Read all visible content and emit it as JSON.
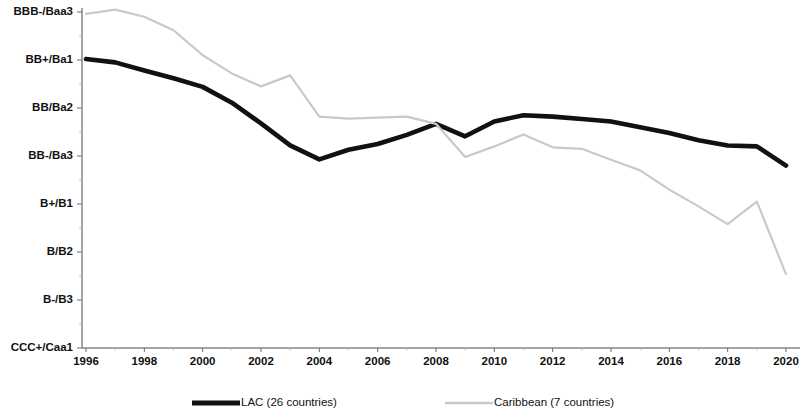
{
  "chart_data": {
    "type": "line",
    "title": "",
    "subtitle": "",
    "xlabel": "",
    "ylabel": "",
    "grid": false,
    "legend_position": "bottom",
    "x": [
      1996,
      1997,
      1998,
      1999,
      2000,
      2001,
      2002,
      2003,
      2004,
      2005,
      2006,
      2007,
      2008,
      2009,
      2010,
      2011,
      2012,
      2013,
      2014,
      2015,
      2016,
      2017,
      2018,
      2019,
      2020
    ],
    "x_tick_labels": [
      "1996",
      "1998",
      "2000",
      "2002",
      "2004",
      "2006",
      "2008",
      "2010",
      "2012",
      "2014",
      "2016",
      "2018",
      "2020"
    ],
    "xlim": [
      1996,
      2020
    ],
    "y_tick_labels": [
      "BBB-/Baa3",
      "BB+/Ba1",
      "BB/Ba2",
      "BB-/Ba3",
      "B+/B1",
      "B/B2",
      "B-/B3",
      "CCC+/Caa1"
    ],
    "y_tick_values": [
      8,
      7,
      6,
      5,
      4,
      3,
      2,
      1
    ],
    "ylim": [
      1,
      8
    ],
    "series": [
      {
        "name": "LAC (26 countries)",
        "color": "#111111",
        "style": "thick-solid",
        "values": [
          7.02,
          6.95,
          6.78,
          6.62,
          6.44,
          6.11,
          5.68,
          5.22,
          4.93,
          5.13,
          5.25,
          5.44,
          5.67,
          5.41,
          5.72,
          5.85,
          5.82,
          5.77,
          5.72,
          5.6,
          5.48,
          5.33,
          5.22,
          5.2,
          4.8
        ]
      },
      {
        "name": "Caribbean (7 countries)",
        "color": "#c9c9c9",
        "style": "thin-solid",
        "values": [
          7.96,
          8.05,
          7.9,
          7.62,
          7.1,
          6.72,
          6.45,
          6.68,
          5.82,
          5.78,
          5.8,
          5.82,
          5.67,
          4.98,
          5.2,
          5.45,
          5.18,
          5.15,
          4.92,
          4.7,
          4.3,
          3.95,
          3.58,
          4.05,
          2.54
        ]
      }
    ],
    "legend": [
      {
        "label": "LAC (26 countries)",
        "swatch": "thick-black-line"
      },
      {
        "label": "Caribbean (7 countries)",
        "swatch": "thin-gray-line"
      }
    ]
  }
}
